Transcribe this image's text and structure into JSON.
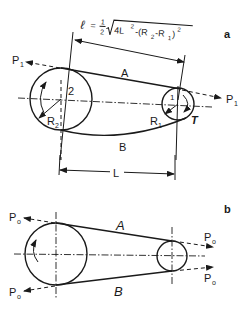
{
  "figure": {
    "panel_a": {
      "label": "a",
      "formula": {
        "lhs": "ℓ",
        "eq": "=",
        "num": "1",
        "den": "2",
        "radicand_1": "4L",
        "sup_1": "2",
        "radicand_2": "-(R",
        "sub_2": "2",
        "radicand_3": "-R",
        "sub_3": "1",
        "radicand_4": ")",
        "sup_4": "2"
      },
      "force_left": {
        "main": "P",
        "sub": "1"
      },
      "force_right": {
        "main": "P",
        "sub": "1"
      },
      "strand_top": "A",
      "strand_bottom": "B",
      "pulley_large": {
        "number": "2",
        "radius_main": "R",
        "radius_sub": "2"
      },
      "pulley_small": {
        "number": "1",
        "radius_main": "R",
        "radius_sub": "1",
        "torque": "T"
      },
      "distance": "L"
    },
    "panel_b": {
      "label": "b",
      "force_top_left": {
        "main": "P",
        "sub": "o"
      },
      "force_bottom_left": {
        "main": "P",
        "sub": "o"
      },
      "force_top_right": {
        "main": "P",
        "sub": "o"
      },
      "force_bottom_right": {
        "main": "P",
        "sub": "o"
      },
      "strand_top": "A",
      "strand_bottom": "B"
    }
  }
}
